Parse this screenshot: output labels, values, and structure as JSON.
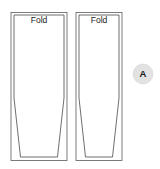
{
  "diagram": {
    "type": "sewing-pattern-layout",
    "background_color": "#ffffff",
    "line_color": "#5a5a5a",
    "cut_line_color": "#3d3d3d",
    "panels": [
      {
        "id": "panel-left",
        "fold_label": "Fold",
        "frame": {
          "x": 11,
          "y": 12.5,
          "width": 56,
          "height": 148
        },
        "cut_shape_points": "14,15 64,15 64,98 57.5,157 20.5,157 14,98",
        "label_position": {
          "x": 39,
          "y": 21
        }
      },
      {
        "id": "panel-right",
        "fold_label": "Fold",
        "frame": {
          "x": 76,
          "y": 12.5,
          "width": 46,
          "height": 148
        },
        "cut_shape_points": "79,15 119,15 119,98 112.5,157 85.5,157 79,98",
        "label_position": {
          "x": 99,
          "y": 21
        }
      }
    ],
    "badge": {
      "label": "A",
      "center_x": 143,
      "center_y": 74,
      "radius": 10,
      "fill_color": "#e2e2e2",
      "text_color": "#1a1a1a"
    }
  }
}
